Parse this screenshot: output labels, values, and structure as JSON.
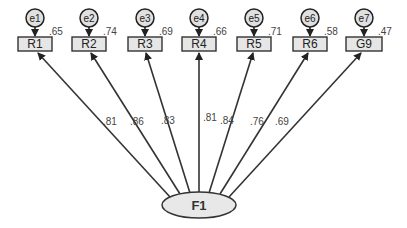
{
  "diagram": {
    "type": "confirmatory-factor-analysis",
    "factor": {
      "label": "F1"
    },
    "indicators": [
      {
        "label": "R1",
        "error": "e1",
        "r2": ".65",
        "loading": ".81"
      },
      {
        "label": "R2",
        "error": "e2",
        "r2": ".74",
        "loading": ".86"
      },
      {
        "label": "R3",
        "error": "e3",
        "r2": ".69",
        "loading": ".83"
      },
      {
        "label": "R4",
        "error": "e4",
        "r2": ".66",
        "loading": ".81"
      },
      {
        "label": "R5",
        "error": "e5",
        "r2": ".71",
        "loading": ".84"
      },
      {
        "label": "R6",
        "error": "e6",
        "r2": ".58",
        "loading": ".76"
      },
      {
        "label": "G9",
        "error": "e7",
        "r2": ".47",
        "loading": ".69"
      }
    ],
    "colors": {
      "box_fill": "#e6e6e6",
      "ellipse_fill": "#e8e8e8",
      "stroke": "#333333"
    }
  }
}
